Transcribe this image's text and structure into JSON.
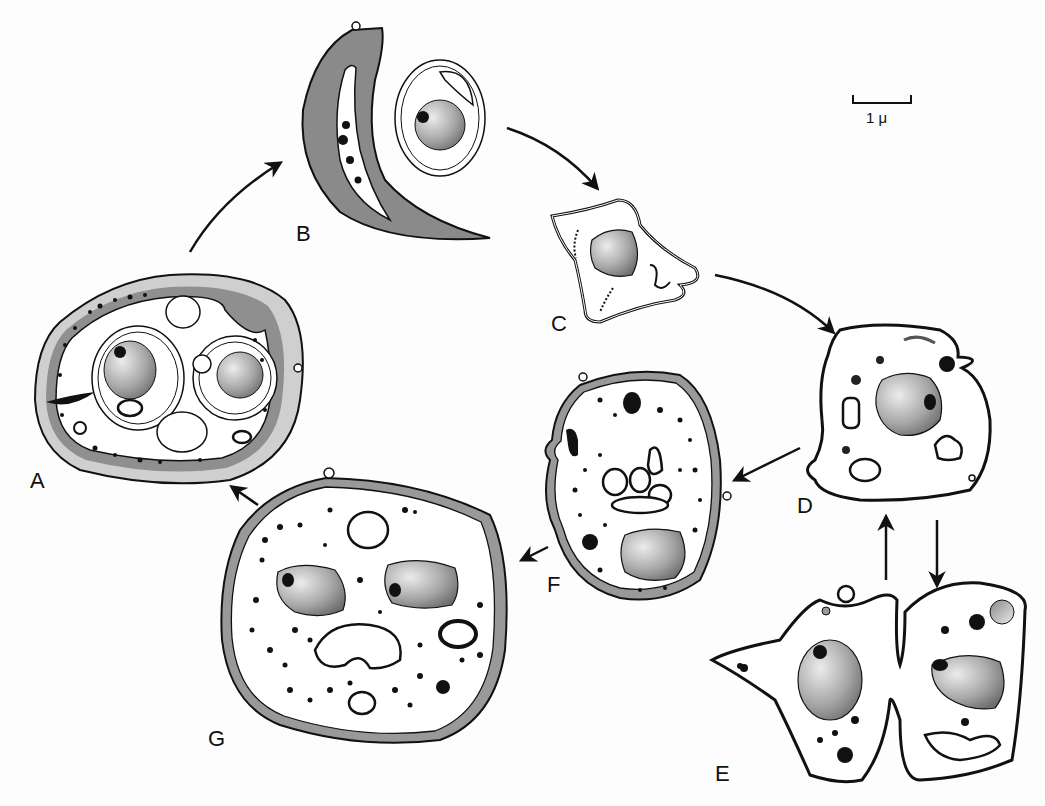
{
  "diagram": {
    "type": "cell life cycle",
    "scale_bar": {
      "label": "1 μ"
    },
    "stages": [
      {
        "id": "A",
        "label": "A",
        "description": "thick-walled cyst with two nucleated cells"
      },
      {
        "id": "B",
        "label": "B",
        "description": "crescent-shaped empty wall shell and released rounded cell"
      },
      {
        "id": "C",
        "label": "C",
        "description": "irregular amoeboid cell"
      },
      {
        "id": "D",
        "label": "D",
        "description": "amoeboid cell with nucleus and vesicles"
      },
      {
        "id": "E",
        "label": "E",
        "description": "two dividing amoeboid cells"
      },
      {
        "id": "F",
        "label": "F",
        "description": "oval walled cell with granules"
      },
      {
        "id": "G",
        "label": "G",
        "description": "large walled cell with two nuclei"
      }
    ],
    "arrows": [
      {
        "from": "A",
        "to": "B"
      },
      {
        "from": "B",
        "to": "C"
      },
      {
        "from": "C",
        "to": "D"
      },
      {
        "from": "D",
        "to": "E"
      },
      {
        "from": "E",
        "to": "D"
      },
      {
        "from": "D",
        "to": "F"
      },
      {
        "from": "F",
        "to": "G"
      },
      {
        "from": "G",
        "to": "A"
      }
    ],
    "colors": {
      "outline": "#111111",
      "wall_gray": "#8a8a8a",
      "wall_light": "#cfcfcf",
      "nucleus_dark": "#7a7a7a",
      "nucleus_light": "#e6e6e6",
      "background": "#fdfdfd"
    }
  }
}
